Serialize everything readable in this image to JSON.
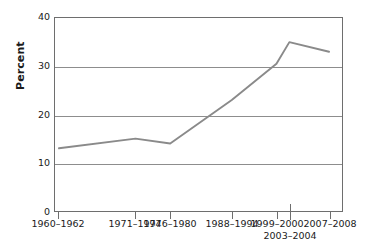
{
  "chart_data": {
    "type": "line",
    "title": "",
    "subtitle": "",
    "xlabel": "",
    "ylabel": "Percent",
    "ylim": [
      0,
      40
    ],
    "yticks": [
      0,
      10,
      20,
      30,
      40
    ],
    "ytick_labels": [
      "0",
      "10",
      "20",
      "30",
      "40"
    ],
    "grid": "horizontal",
    "legend": "none",
    "line_color": "#8a8a8a",
    "axis_color": "#6e6e6e",
    "grid_color": "#8d8d8d",
    "categories": [
      "1960–1962",
      "1971–1974",
      "1976–1980",
      "1988–1994",
      "1999–2000",
      "2003–2004",
      "2007–2008"
    ],
    "x_positions_px": [
      58,
      135,
      170,
      232,
      277,
      290,
      330
    ],
    "series": [
      {
        "name": "Percent",
        "values": [
          13,
          15,
          14,
          23,
          30.5,
          35,
          33
        ]
      }
    ],
    "annotations": []
  },
  "axes": {
    "y_title": "Percent",
    "y_tick_labels": [
      {
        "text": "40",
        "value": 40
      },
      {
        "text": "30",
        "value": 30
      },
      {
        "text": "20",
        "value": 20
      },
      {
        "text": "10",
        "value": 10
      },
      {
        "text": "0",
        "value": 0
      }
    ],
    "x_tick_labels": [
      {
        "text": "1960–1962",
        "row": 0,
        "x": 58
      },
      {
        "text": "1971–1974",
        "row": 0,
        "x": 135
      },
      {
        "text": "1976–1980",
        "row": 0,
        "x": 170
      },
      {
        "text": "1988–1994",
        "row": 0,
        "x": 232
      },
      {
        "text": "1999–2000",
        "row": 0,
        "x": 277
      },
      {
        "text": "2003–2004",
        "row": 1,
        "x": 290
      },
      {
        "text": "2007–2008",
        "row": 0,
        "x": 330
      }
    ]
  }
}
